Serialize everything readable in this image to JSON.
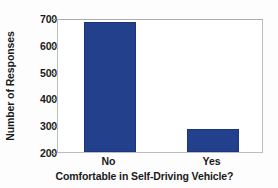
{
  "chart_data": {
    "type": "bar",
    "title": "",
    "subtitle": "",
    "xlabel": "Comfortable in Self-Driving Vehicle?",
    "ylabel": "Number of Responses",
    "categories": [
      "No",
      "Yes"
    ],
    "values": [
      685,
      285
    ],
    "series": [
      {
        "name": "Number of Responses",
        "values": [
          685,
          285
        ],
        "color": "#22408C"
      }
    ],
    "ylim": [
      200,
      700
    ],
    "yticks": [
      200,
      300,
      400,
      500,
      600,
      700
    ],
    "ytick_labels": [
      "200",
      "300",
      "400",
      "500",
      "600",
      "700"
    ],
    "xtick_labels": [
      "No",
      "Yes"
    ],
    "grid": false,
    "legend": false,
    "legend_position": "none",
    "bar_color": "#22408C",
    "bar_edge_color": "#1B3578",
    "axis_color": "#B9BCC0",
    "background_color": "#FFFFFF",
    "annotations": [],
    "note": "y-axis is truncated and begins at 200"
  }
}
